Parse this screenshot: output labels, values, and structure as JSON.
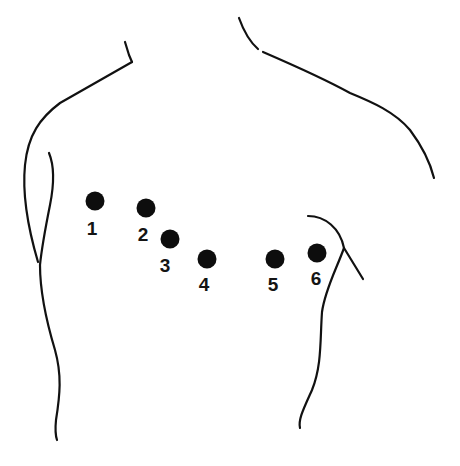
{
  "figure": {
    "colors": {
      "ink": "#111111",
      "background": "#ffffff"
    },
    "electrodes": [
      {
        "id": "1",
        "label": "1",
        "cx": 95,
        "cy": 201,
        "label_x": 92,
        "label_y": 219
      },
      {
        "id": "2",
        "label": "2",
        "cx": 146,
        "cy": 208,
        "label_x": 143,
        "label_y": 225
      },
      {
        "id": "3",
        "label": "3",
        "cx": 170,
        "cy": 239,
        "label_x": 165,
        "label_y": 256
      },
      {
        "id": "4",
        "label": "4",
        "cx": 207,
        "cy": 259,
        "label_x": 204,
        "label_y": 275
      },
      {
        "id": "5",
        "label": "5",
        "cx": 275,
        "cy": 259,
        "label_x": 273,
        "label_y": 275
      },
      {
        "id": "6",
        "label": "6",
        "cx": 317,
        "cy": 253,
        "label_x": 316,
        "label_y": 269
      }
    ]
  }
}
